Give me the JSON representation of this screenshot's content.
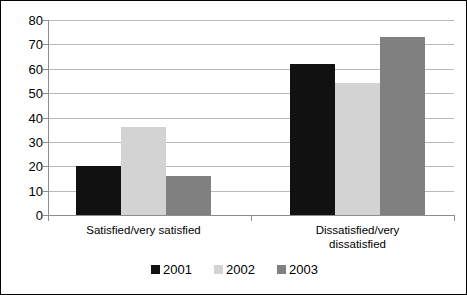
{
  "chart_data": {
    "type": "bar",
    "title": "",
    "subtitle": "",
    "xlabel": "",
    "ylabel": "",
    "categories": [
      "Satisfied/very satisfied",
      "Dissatisfied/very dissatisfied"
    ],
    "category_lines": [
      [
        "Satisfied/very satisfied"
      ],
      [
        "Dissatisfied/very",
        "dissatisfied"
      ]
    ],
    "series": [
      {
        "name": "2001",
        "color": "#111111",
        "values": [
          20,
          62
        ]
      },
      {
        "name": "2002",
        "color": "#d3d3d3",
        "values": [
          36,
          54
        ]
      },
      {
        "name": "2003",
        "color": "#808080",
        "values": [
          16,
          73
        ]
      }
    ],
    "ylim": [
      0,
      80
    ],
    "ytick_step": 10,
    "yticks": [
      0,
      10,
      20,
      30,
      40,
      50,
      60,
      70,
      80
    ],
    "ytick_labels": [
      "0",
      "10",
      "20",
      "30",
      "40",
      "50",
      "60",
      "70",
      "80"
    ],
    "grid": true,
    "grid_axis": "y",
    "legend_position": "bottom",
    "legend_entries": [
      "2001",
      "2002",
      "2003"
    ],
    "axis_color": "#8d8d8d",
    "gridline_color": "#b9b9b9",
    "background_color": "#ffffff",
    "border": {
      "visible": true,
      "color": "#000000"
    }
  }
}
